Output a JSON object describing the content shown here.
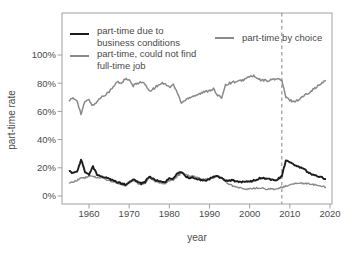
{
  "figure": {
    "background": "#ffffff",
    "text_color": "#4a4a4a",
    "axis_color": "#a0a0a0",
    "series_colors": {
      "business": "#1c1c1c",
      "could_not_find": "#8a8a8a",
      "by_choice": "#8a8a8a"
    },
    "dashed_line_color": "#9a9a9a"
  },
  "legend": {
    "entries": [
      {
        "lines": [
          "part-time due to",
          "business conditions"
        ],
        "color": "#1c1c1c",
        "thickness": 2
      },
      {
        "lines": [
          "part-time, could not find",
          "full-time job"
        ],
        "color": "#8a8a8a",
        "thickness": 1.5
      },
      {
        "lines": [
          "part-time by choice"
        ],
        "color": "#8a8a8a",
        "thickness": 1.5
      }
    ]
  },
  "chart_data": {
    "type": "line",
    "title": "",
    "xlabel": "year",
    "ylabel": "part-time rate",
    "xlim": [
      1954,
      2021
    ],
    "ylim": [
      0,
      100
    ],
    "grid": false,
    "x_ticks": [
      1960,
      1970,
      1980,
      1990,
      2000,
      2010,
      2020
    ],
    "y_ticks": [
      0,
      20,
      40,
      60,
      80,
      100
    ],
    "y_tick_labels": [
      "0%",
      "20%",
      "40%",
      "60%",
      "80%",
      "100%"
    ],
    "vline": {
      "x": 2008,
      "style": "dashed",
      "color": "#9a9a9a"
    },
    "x": [
      1955,
      1956,
      1957,
      1958,
      1959,
      1960,
      1961,
      1962,
      1963,
      1964,
      1965,
      1966,
      1967,
      1968,
      1969,
      1970,
      1971,
      1972,
      1973,
      1974,
      1975,
      1976,
      1977,
      1978,
      1979,
      1980,
      1981,
      1982,
      1983,
      1984,
      1985,
      1986,
      1987,
      1988,
      1989,
      1990,
      1991,
      1992,
      1993,
      1994,
      1995,
      1996,
      1997,
      1998,
      1999,
      2000,
      2001,
      2002,
      2003,
      2004,
      2005,
      2006,
      2007,
      2008,
      2009,
      2010,
      2011,
      2012,
      2013,
      2014,
      2015,
      2016,
      2017,
      2018,
      2019
    ],
    "series": [
      {
        "name": "part-time by choice",
        "color": "#8a8a8a",
        "width": 1.5,
        "values": [
          68,
          69,
          68,
          58,
          67,
          68,
          64,
          67,
          70,
          72,
          74,
          77,
          81,
          80,
          83,
          82,
          78,
          80,
          81,
          79,
          74,
          76,
          78,
          80,
          80,
          77,
          79,
          73,
          66,
          68,
          70,
          71,
          72,
          73,
          74,
          75,
          76,
          71,
          70,
          79,
          80,
          81,
          81,
          82,
          83,
          85,
          85,
          83,
          82,
          82,
          82,
          83,
          83,
          82,
          70,
          68,
          67,
          68,
          70,
          72,
          74,
          76,
          78,
          80,
          82
        ]
      },
      {
        "name": "part-time, could not find full-time job",
        "color": "#8a8a8a",
        "width": 1.4,
        "values": [
          9,
          10,
          11,
          13,
          13,
          14,
          14,
          13,
          13,
          12,
          11,
          10,
          9,
          8,
          7,
          9,
          11,
          9,
          8,
          9,
          13,
          11,
          10,
          9,
          9,
          11,
          11,
          14,
          16,
          15,
          14,
          14,
          13,
          12,
          12,
          12,
          13,
          14,
          13,
          10,
          8,
          7,
          6,
          5.5,
          5,
          5,
          5.5,
          5.5,
          5.5,
          5,
          5,
          5,
          5.5,
          6,
          7,
          8,
          8.5,
          9,
          9,
          9,
          8.5,
          8,
          7.5,
          7,
          6
        ]
      },
      {
        "name": "part-time due to business conditions",
        "color": "#1c1c1c",
        "width": 1.9,
        "values": [
          18,
          16,
          17,
          26,
          17,
          15,
          21,
          15,
          14,
          13,
          12,
          11,
          10,
          9,
          8,
          10,
          12,
          10,
          9,
          10,
          14,
          12,
          11,
          10,
          10,
          13,
          12,
          16,
          17,
          14,
          13,
          13,
          12,
          11,
          11,
          12,
          14,
          14,
          13,
          11,
          11,
          11,
          10,
          10,
          10,
          10,
          11,
          12,
          13,
          12,
          12,
          11,
          12,
          14,
          25,
          24,
          22,
          21,
          20,
          18,
          16,
          15,
          14,
          13,
          12
        ]
      }
    ]
  }
}
